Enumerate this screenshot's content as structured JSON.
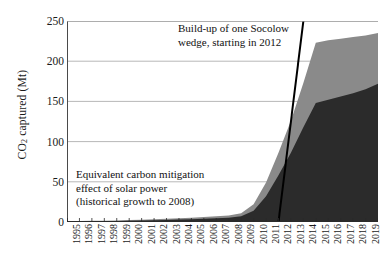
{
  "chart_data": {
    "type": "area",
    "title": "",
    "xlabel": "",
    "ylabel": "CO2 captured (Mt)",
    "ylabel_parts": {
      "pre": "CO",
      "sub": "2",
      "post": " captured (Mt)"
    },
    "ylim": [
      0,
      250
    ],
    "yticks": [
      0,
      50,
      100,
      150,
      200,
      250
    ],
    "grid": true,
    "legend": "none",
    "categories": [
      "1995",
      "1996",
      "1997",
      "1998",
      "1999",
      "2000",
      "2001",
      "2002",
      "2003",
      "2004",
      "2005",
      "2006",
      "2007",
      "2008",
      "2009",
      "2010",
      "2011",
      "2012",
      "2013",
      "2014",
      "2015",
      "2016",
      "2017",
      "2018",
      "2019",
      "2020"
    ],
    "series": [
      {
        "name": "lower-dark-band",
        "color": "#2b2b2b",
        "values": [
          0.5,
          0.7,
          0.9,
          1.1,
          1.3,
          1.6,
          1.9,
          2.2,
          2.6,
          3.0,
          3.5,
          4.0,
          4.6,
          5.2,
          7.0,
          14.0,
          32.0,
          58.0,
          86.0,
          118.0,
          148.0,
          152.0,
          156.0,
          160.0,
          165.0,
          172.0
        ]
      },
      {
        "name": "upper-light-band",
        "color": "#8a8a8a",
        "values": [
          0.3,
          0.4,
          0.5,
          0.6,
          0.7,
          0.9,
          1.0,
          1.2,
          1.4,
          1.6,
          1.9,
          2.2,
          2.5,
          2.8,
          4.0,
          8.0,
          17.0,
          28.0,
          40.0,
          55.0,
          75.0,
          74.0,
          72.0,
          70.0,
          67.0,
          63.0
        ]
      }
    ],
    "reference_line": {
      "name": "socolow-wedge-line",
      "color": "#000000",
      "start": {
        "x": "2012",
        "y": 0
      },
      "end": {
        "x": "2014",
        "y": 250
      }
    },
    "annotations": [
      {
        "name": "wedge-annotation",
        "lines": [
          "Build-up of one Socolow",
          "wedge, starting in 2012"
        ]
      },
      {
        "name": "solar-annotation",
        "lines": [
          "Equivalent carbon mitigation",
          "effect of solar power",
          "(historical growth to 2008)"
        ]
      }
    ]
  },
  "axis": {
    "y_title_pre": "CO",
    "y_title_sub": "2",
    "y_title_post": " captured (Mt)"
  }
}
